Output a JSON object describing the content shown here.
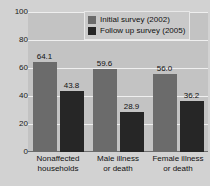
{
  "chart_data": {
    "type": "bar",
    "title": "",
    "xlabel": "",
    "ylabel": "",
    "ylim": [
      0,
      100
    ],
    "yticks": [
      0,
      20,
      40,
      60,
      80,
      100
    ],
    "ytick_labels": [
      "0",
      "20",
      "40",
      "60",
      "80",
      "100"
    ],
    "grid": true,
    "legend_position": "top-right",
    "categories": [
      "Nonaffected households",
      "Male illness or death",
      "Female illness or death"
    ],
    "category_lines": [
      [
        "Nonaffected",
        "households"
      ],
      [
        "Male illness",
        "or death"
      ],
      [
        "Female illness",
        "or death"
      ]
    ],
    "series": [
      {
        "name": "Initial survey (2002)",
        "color": "#6b6b6b",
        "values": [
          64.1,
          59.6,
          56.0
        ],
        "value_labels": [
          "64.1",
          "59.6",
          "56.0"
        ]
      },
      {
        "name": "Follow up survey (2005)",
        "color": "#262626",
        "values": [
          43.8,
          28.9,
          36.2
        ],
        "value_labels": [
          "43.8",
          "28.9",
          "36.2"
        ]
      }
    ]
  },
  "colors": {
    "page_background": "#d2d2d2",
    "plot_background": "#c3c3c3",
    "gridline": "#efefef",
    "axis": "#6e6e6e",
    "series_initial": "#6b6b6b",
    "series_followup": "#262626",
    "text": "#111111"
  }
}
